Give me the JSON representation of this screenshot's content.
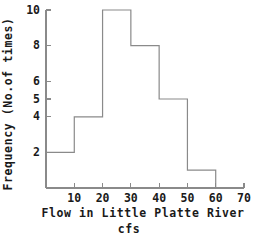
{
  "chart_data": {
    "type": "bar",
    "title": "",
    "subtitle": "",
    "xlabel_line1": "Flow in Little Platte River",
    "xlabel_line2": "cfs",
    "ylabel": "Frequency (No.of times)",
    "bin_edges": [
      0,
      10,
      20,
      30,
      40,
      50,
      60
    ],
    "categories": [
      "0-10",
      "10-20",
      "20-30",
      "30-40",
      "40-50",
      "50-60"
    ],
    "values": [
      2,
      4,
      10,
      8,
      5,
      1
    ],
    "xlim": [
      0,
      70
    ],
    "ylim": [
      0,
      10
    ],
    "xticks": [
      10,
      20,
      30,
      40,
      50,
      60,
      70
    ],
    "xtick_labels": [
      "10",
      "20",
      "30",
      "40",
      "50",
      "60",
      "70"
    ],
    "yticks": [
      2,
      4,
      5,
      6,
      8,
      10
    ],
    "ytick_labels": [
      "2",
      "4",
      "5",
      "6",
      "8",
      "10"
    ],
    "grid": false,
    "legend": "none",
    "line_color": "#8a8a8a",
    "text_color": "#1a1a1a",
    "background_color": "#ffffff"
  }
}
